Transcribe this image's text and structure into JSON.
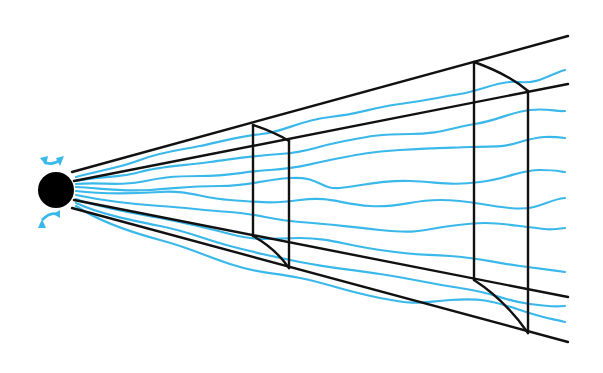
{
  "diagram": {
    "title": "",
    "colors": {
      "frame": "#111111",
      "waves": "#3bb8ea",
      "source": "#000000",
      "background": "#ffffff"
    },
    "source": {
      "cx": 56,
      "cy": 190,
      "r": 18
    },
    "rays": [
      {
        "name": "top-outer",
        "x1": 72,
        "y1": 172,
        "x2": 568,
        "y2": 36
      },
      {
        "name": "top-inner",
        "x1": 74,
        "y1": 181,
        "x2": 568,
        "y2": 84
      },
      {
        "name": "bottom-inner",
        "x1": 74,
        "y1": 200,
        "x2": 568,
        "y2": 297
      },
      {
        "name": "bottom-outer",
        "x1": 72,
        "y1": 208,
        "x2": 568,
        "y2": 342
      }
    ],
    "sections": [
      {
        "name": "near-section",
        "left_x": 253,
        "right_x": 289
      },
      {
        "name": "far-section",
        "left_x": 474,
        "right_x": 528
      }
    ],
    "wave_count": 9,
    "labels": []
  }
}
